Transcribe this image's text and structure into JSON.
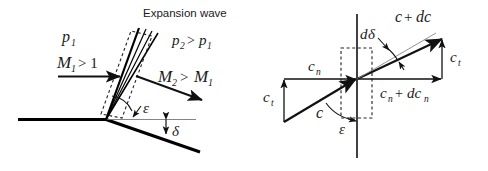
{
  "figure": {
    "title_visible": "Expansion wave",
    "panels": [
      {
        "id": "left",
        "name": "expansion-wave-flow-geometry",
        "labels": {
          "expansion_wave": "Expansion wave",
          "p1": "p",
          "p1_sub": "1",
          "p2_rel": "p",
          "p2_sub": "2",
          "gt": ">",
          "p1_rhs": "p",
          "p1_rhs_sub": "1",
          "m1": "M",
          "m1_sub": "1",
          "m1_rel": "> 1",
          "m2": "M",
          "m2_sub": "2",
          "m2_rel": ">",
          "m2_rhs": "M",
          "m2_rhs_sub": "1",
          "epsilon": "ε",
          "delta": "δ"
        }
      },
      {
        "id": "right",
        "name": "velocity-vector-triangle",
        "labels": {
          "c_plus_dc": "c",
          "c_plus_dc_op": "+",
          "c_plus_dc_d": "dc",
          "d_delta": "d",
          "d_delta_sym": "δ",
          "cn_in": "c",
          "cn_in_sub": "n",
          "ct_left": "c",
          "ct_left_sub": "t",
          "ct_right": "c",
          "ct_right_sub": "t",
          "cn_out": "c",
          "cn_out_sub": "n",
          "cn_out_op": "+",
          "cn_out_d": "dc",
          "cn_out_d_sub": "n",
          "c_vec": "c",
          "epsilon": "ε"
        }
      }
    ]
  },
  "colors": {
    "ink": "#1a1a1a",
    "line": "#000000",
    "thin": "#555555",
    "background": "#ffffff"
  }
}
